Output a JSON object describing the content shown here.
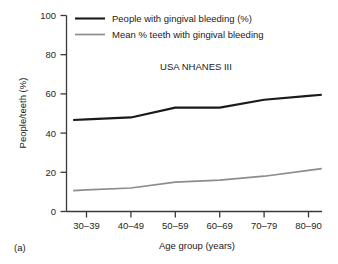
{
  "figure": {
    "panel_label": "(a)",
    "annotation": "USA NHANES III",
    "colors": {
      "series_people": "#1a1a1a",
      "series_teeth": "#8c8c8c",
      "axis": "#3a3a3a",
      "background": "#ffffff"
    }
  },
  "chart_data": {
    "type": "line",
    "title": "",
    "subtitle": "",
    "annotation": "USA NHANES III",
    "xlabel": "Age group (years)",
    "ylabel": "People/teeth (%)",
    "categories": [
      "30–39",
      "40–49",
      "50–59",
      "60–69",
      "70–79",
      "80–90"
    ],
    "series": [
      {
        "name": "People with gingival bleeding (%)",
        "color": "#1a1a1a",
        "values": [
          47,
          48,
          53,
          53,
          57,
          59
        ]
      },
      {
        "name": "Mean % teeth with gingival bleeding",
        "color": "#8c8c8c",
        "values": [
          11,
          12,
          15,
          16,
          18,
          21
        ]
      }
    ],
    "ylim": [
      0,
      100
    ],
    "yticks": [
      0,
      20,
      40,
      60,
      80,
      100
    ],
    "ytick_labels": [
      "0",
      "20",
      "40",
      "60",
      "80",
      "100"
    ],
    "grid": false,
    "legend_position": "top-left-inside"
  },
  "legend": {
    "entries": [
      {
        "label": "People with gingival bleeding (%)"
      },
      {
        "label": "Mean % teeth with gingival bleeding"
      }
    ]
  }
}
